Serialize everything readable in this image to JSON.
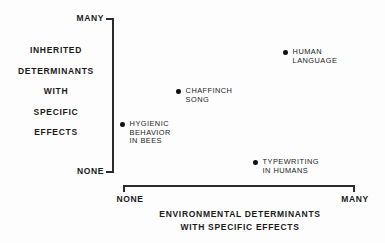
{
  "chart_data": {
    "type": "scatter",
    "title": "",
    "xlabel": "ENVIRONMENTAL DETERMINANTS WITH SPECIFIC EFFECTS",
    "ylabel": "INHERITED DETERMINANTS WITH SPECIFIC EFFECTS",
    "xlim": [
      "NONE",
      "MANY"
    ],
    "ylim": [
      "NONE",
      "MANY"
    ],
    "x_tick_labels": [
      "NONE",
      "MANY"
    ],
    "y_tick_labels": [
      "NONE",
      "MANY"
    ],
    "grid": false,
    "legend": "none",
    "points": [
      {
        "name": "hygienic-behavior-in-bees",
        "label_lines": [
          "HYGIENIC",
          "BEHAVIOR",
          "IN BEES"
        ],
        "x": 0.05,
        "y": 0.33,
        "px": 120,
        "py": 120
      },
      {
        "name": "chaffinch-song",
        "label_lines": [
          "CHAFFINCH",
          "SONG"
        ],
        "x": 0.29,
        "y": 0.54,
        "px": 176,
        "py": 87
      },
      {
        "name": "human-language",
        "label_lines": [
          "HUMAN",
          "LANGUAGE"
        ],
        "x": 0.74,
        "y": 0.78,
        "px": 283,
        "py": 48
      },
      {
        "name": "typewriting-in-humans",
        "label_lines": [
          "TYPEWRITING",
          "IN HUMANS"
        ],
        "x": 0.6,
        "y": 0.09,
        "px": 253,
        "py": 158
      }
    ]
  },
  "axes": {
    "y": {
      "top_label": "MANY",
      "bottom_label": "NONE",
      "title_lines": [
        "INHERITED",
        "DETERMINANTS",
        "WITH",
        "SPECIFIC",
        "EFFECTS"
      ]
    },
    "x": {
      "left_label": "NONE",
      "right_label": "MANY",
      "title_lines": [
        "ENVIRONMENTAL  DETERMINANTS",
        "WITH SPECIFIC EFFECTS"
      ]
    }
  },
  "colors": {
    "ink": "#1a1a1a",
    "axis": "#2b2b2b",
    "point": "#111111",
    "background": "#fdfdfd"
  }
}
